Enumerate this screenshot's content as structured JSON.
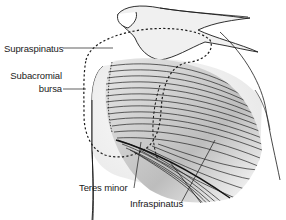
{
  "diagram": {
    "labels": [
      {
        "id": "supraspinatus",
        "text": "Supraspinatus"
      },
      {
        "id": "subacromial-bursa-1",
        "text": "Subacromial"
      },
      {
        "id": "subacromial-bursa-2",
        "text": "bursa"
      },
      {
        "id": "teres-minor",
        "text": "Teres minor"
      },
      {
        "id": "infraspinatus",
        "text": "Infraspinatus"
      }
    ],
    "colors": {
      "line": "#1a1a1a",
      "bone_fill": "#f2f2f2",
      "muscle_shade": "#d4d4d4",
      "background": "#ffffff"
    }
  }
}
